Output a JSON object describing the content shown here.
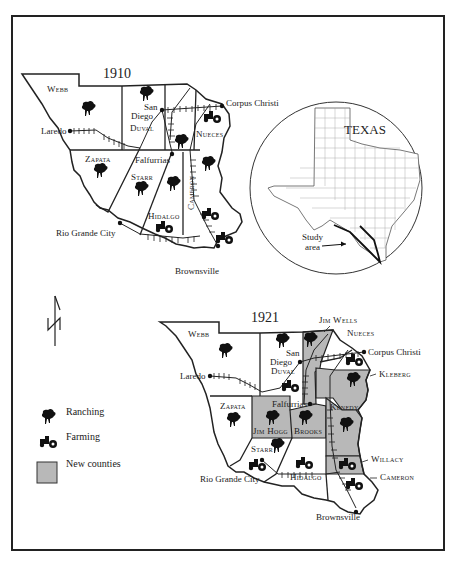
{
  "colors": {
    "border": "#222222",
    "new_county_fill": "#b8b8b8",
    "background": "#ffffff",
    "ink": "#1a1a1a"
  },
  "map_1910": {
    "year": "1910",
    "counties": [
      "Webb",
      "Duval",
      "Nueces",
      "Zapata",
      "Starr",
      "Hidalgo",
      "Cameron"
    ],
    "cities": [
      "Laredo",
      "San Diego",
      "Corpus Christi",
      "Falfurrias",
      "Rio Grande City",
      "Brownsville"
    ],
    "symbols": {
      "ranching": [
        "Webb",
        "Duval",
        "Nueces",
        "Zapata",
        "Starr",
        "Starr (east)",
        "Cameron"
      ],
      "farming": [
        "Nueces",
        "Hidalgo",
        "Cameron",
        "Cameron (south)"
      ]
    }
  },
  "map_1921": {
    "year": "1921",
    "counties": [
      "Webb",
      "Duval",
      "Jim Wells",
      "Nueces",
      "Kleberg",
      "Zapata",
      "Jim Hogg",
      "Brooks",
      "Kenedy",
      "Starr",
      "Hidalgo",
      "Willacy",
      "Cameron"
    ],
    "new_counties": [
      "Jim Wells",
      "Kleberg",
      "Jim Hogg",
      "Brooks",
      "Kenedy",
      "Willacy"
    ],
    "cities": [
      "Laredo",
      "San Diego",
      "Corpus Christi",
      "Falfurrias",
      "Rio Grande City",
      "Brownsville"
    ],
    "symbols": {
      "ranching": [
        "Webb",
        "Duval",
        "Jim Wells",
        "Kleberg",
        "Zapata",
        "Jim Hogg",
        "Brooks",
        "Kenedy",
        "Starr"
      ],
      "farming": [
        "Duval",
        "Nueces",
        "Starr",
        "Hidalgo",
        "Willacy",
        "Cameron"
      ]
    }
  },
  "inset": {
    "title": "TEXAS",
    "pointer_label_line1": "Study",
    "pointer_label_line2": "area"
  },
  "legend": {
    "items": [
      {
        "icon": "ranching-icon",
        "label": "Ranching"
      },
      {
        "icon": "farming-icon",
        "label": "Farming"
      },
      {
        "icon": "new-counties-swatch",
        "label": "New counties"
      }
    ]
  },
  "north_arrow": "N",
  "labels": {
    "webb": "Webb",
    "duval": "Duval",
    "nueces": "Nueces",
    "zapata": "Zapata",
    "starr": "Starr",
    "hidalgo": "Hidalgo",
    "cameron": "Cameron",
    "jim_wells": "Jim Wells",
    "kleberg": "Kleberg",
    "jim_hogg": "Jim Hogg",
    "brooks": "Brooks",
    "kenedy": "Kenedy",
    "willacy": "Willacy",
    "laredo": "Laredo",
    "san": "San",
    "diego": "Diego",
    "corpus_christi": "Corpus Christi",
    "falfurrias": "Falfurrias",
    "rio_grande_city": "Rio Grande City",
    "brownsville": "Brownsville"
  }
}
